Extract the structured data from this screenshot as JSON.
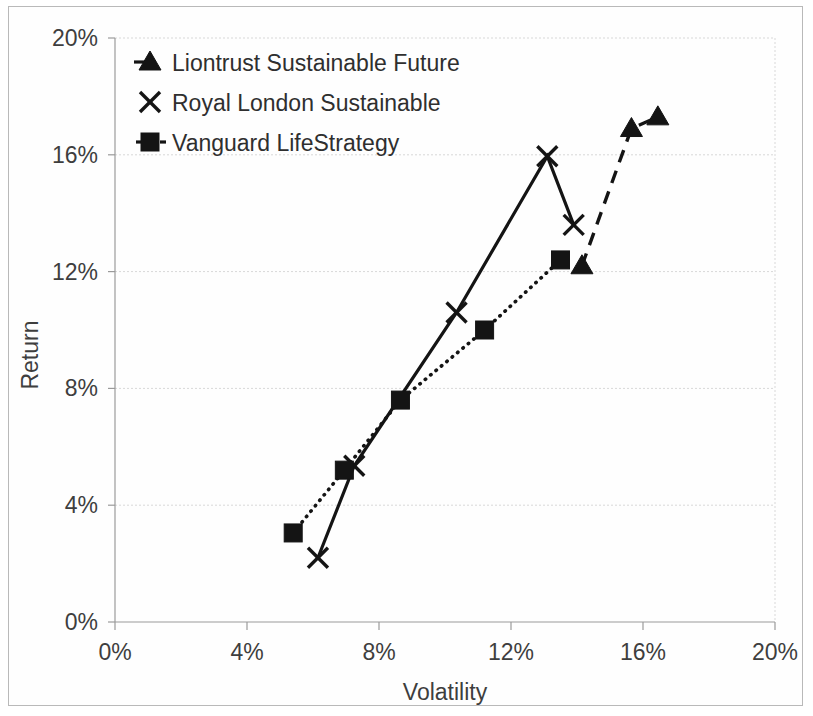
{
  "chart_data": {
    "type": "scatter",
    "title": "",
    "subtitle": "",
    "xlabel": "Volatility",
    "ylabel": "Return",
    "xlim": [
      0,
      20
    ],
    "ylim": [
      0,
      20
    ],
    "x_ticks": [
      "0%",
      "4%",
      "8%",
      "12%",
      "16%",
      "20%"
    ],
    "x_tick_values": [
      0,
      4,
      8,
      12,
      16,
      20
    ],
    "y_ticks": [
      "0%",
      "4%",
      "8%",
      "12%",
      "16%",
      "20%"
    ],
    "y_tick_values": [
      0,
      4,
      8,
      12,
      16,
      20
    ],
    "grid": "horizontal",
    "legend_position": "top-left-inside",
    "series": [
      {
        "name": "Liontrust Sustainable Future",
        "marker": "triangle",
        "line_style": "dashed",
        "points": [
          {
            "x": 14.15,
            "y": 12.2
          },
          {
            "x": 15.65,
            "y": 16.9
          },
          {
            "x": 16.45,
            "y": 17.3
          }
        ]
      },
      {
        "name": "Royal London Sustainable",
        "marker": "x",
        "line_style": "solid",
        "points": [
          {
            "x": 6.15,
            "y": 2.2
          },
          {
            "x": 7.25,
            "y": 5.35
          },
          {
            "x": 10.35,
            "y": 10.6
          },
          {
            "x": 13.1,
            "y": 15.95
          },
          {
            "x": 13.9,
            "y": 13.6
          }
        ]
      },
      {
        "name": "Vanguard LifeStrategy",
        "marker": "square",
        "line_style": "dotted",
        "points": [
          {
            "x": 5.4,
            "y": 3.05
          },
          {
            "x": 6.95,
            "y": 5.2
          },
          {
            "x": 8.65,
            "y": 7.6
          },
          {
            "x": 11.2,
            "y": 10.0
          },
          {
            "x": 13.5,
            "y": 12.4
          }
        ]
      }
    ],
    "colors": {
      "series": "#141414",
      "grid": "#d8d8d8",
      "axis": "#9a9a9a",
      "text": "#3e3e3e",
      "background": "#ffffff"
    }
  }
}
